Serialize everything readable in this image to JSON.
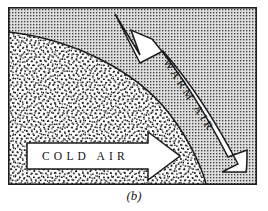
{
  "figure": {
    "caption": "(b)",
    "panel_label": "b",
    "diagram_type": "warm-front-cross-section",
    "frame": {
      "x": 8,
      "y": 7,
      "width": 249,
      "height": 178,
      "border_color": "#1c1c1c",
      "border_width": 1.6
    },
    "regions": [
      {
        "name": "warm-air-region",
        "label": "WARM AIR",
        "fill_style": "fine-regular-dot-screen",
        "fill_color": "#d8d8d8",
        "dot_color": "#4a4a4a",
        "position": "upper-right"
      },
      {
        "name": "cold-air-region",
        "label": "COLD AIR",
        "fill_style": "coarse-random-stipple",
        "fill_color": "#ffffff",
        "dot_color": "#161616",
        "position": "lower-left"
      }
    ],
    "front_boundary": {
      "name": "frontal-surface",
      "description": "curved boundary sloping from upper-left to lower-right",
      "stroke_color": "#1c1c1c",
      "stroke_width": 1.6
    },
    "arrows": [
      {
        "name": "warm-air-arrow",
        "label": "WARM AIR",
        "direction": "up-left",
        "style": "curved-band-with-swallowtail-head",
        "fill": "#ffffff",
        "stroke": "#1c1c1c",
        "text_color": "#111111",
        "letter_spacing": "3px",
        "font_size": "11px"
      },
      {
        "name": "cold-air-arrow",
        "label": "COLD AIR",
        "direction": "right",
        "style": "straight-block-arrow",
        "fill": "#ffffff",
        "stroke": "#1c1c1c",
        "text_color": "#111111",
        "letter_spacing": "4px",
        "font_size": "11px"
      }
    ],
    "colors": {
      "ink": "#1c1c1c",
      "paper": "#ffffff",
      "warm_shade": "#d8d8d8"
    }
  }
}
